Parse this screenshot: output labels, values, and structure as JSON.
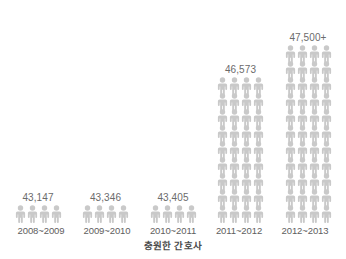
{
  "chart_data": {
    "type": "bar",
    "title": "",
    "subtitle": "",
    "xlabel": "충원한 간호사",
    "ylabel": "",
    "grid": false,
    "legend": null,
    "unit_glyph": "person-icon",
    "categories": [
      "2008~2009",
      "2009~2010",
      "2010~2011",
      "2011~2012",
      "2012~2013"
    ],
    "values": [
      43147,
      43405,
      43405,
      46573,
      47500
    ],
    "value_labels": [
      "43,147",
      "43,346",
      "43,405",
      "46,573",
      "47,500+"
    ],
    "icon_columns": 4,
    "icon_rows": [
      1,
      1,
      1,
      9,
      11
    ],
    "series": [
      {
        "name": "충원한 간호사",
        "values": [
          43147,
          43346,
          43405,
          46573,
          47500
        ]
      }
    ],
    "colors": {
      "icon": "#c9c9c9",
      "value_text": "#6b6b6b",
      "category_text": "#5e5e5e",
      "caption_text": "#4a4a4a",
      "background": "#ffffff"
    }
  },
  "caption": {
    "text": "충원한 간호사"
  }
}
